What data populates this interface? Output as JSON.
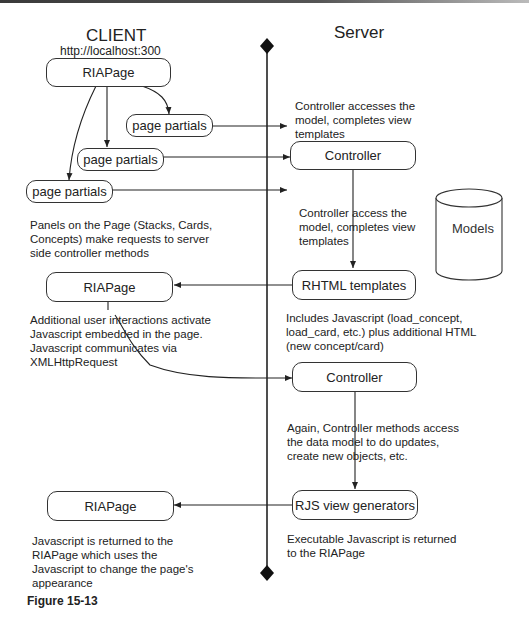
{
  "client": {
    "title": "CLIENT",
    "url": "http://localhost:300"
  },
  "server": {
    "title": "Server"
  },
  "nodes": {
    "riapage_top": "RIAPage",
    "page_partials_1": "page partials",
    "page_partials_2": "page partials",
    "page_partials_3": "page partials",
    "controller_1": "Controller",
    "rhtml_templates": "RHTML templates",
    "riapage_mid": "RIAPage",
    "controller_2": "Controller",
    "rjs_view_generators": "RJS view generators",
    "riapage_bottom": "RIAPage",
    "models": "Models"
  },
  "notes": {
    "controller_accesses_1": "Controller accesses the\nmodel, completes view\ntemplates",
    "controller_accesses_2": "Controller access the\nmodel, completes view\ntemplates",
    "panels_on_page": "Panels on the Page (Stacks, Cards,\nConcepts) make requests to server\nside controller methods",
    "includes_javascript": "Includes Javascript (load_concept,\nload_card, etc.) plus additional HTML\n(new concept/card)",
    "additional_interactions": "Additional user interactions activate\nJavascript embedded in the page.\nJavascript communicates via\nXMLHttpRequest",
    "again_controller": "Again, Controller methods access\nthe data model to do updates,\ncreate new objects, etc.",
    "executable_javascript": "Executable Javascript is returned\nto the RIAPage",
    "javascript_returned": "Javascript is returned to the\nRIAPage which uses the\nJavascript to change the page's\nappearance"
  },
  "figure_label": "Figure 15-13",
  "colors": {
    "line": "#222222",
    "box_border": "#333333",
    "background": "#ffffff"
  }
}
